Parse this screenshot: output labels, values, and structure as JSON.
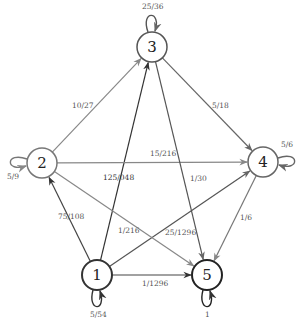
{
  "diagram": {
    "type": "markov-chain-state-graph",
    "nodes": [
      {
        "id": "1",
        "label": "1",
        "x": 97,
        "y": 275,
        "stroke": "#333333",
        "stroke_width": 2
      },
      {
        "id": "2",
        "label": "2",
        "x": 42,
        "y": 163,
        "stroke": "#777777",
        "stroke_width": 1.5
      },
      {
        "id": "3",
        "label": "3",
        "x": 152,
        "y": 47,
        "stroke": "#555555",
        "stroke_width": 1.5
      },
      {
        "id": "4",
        "label": "4",
        "x": 263,
        "y": 162,
        "stroke": "#666666",
        "stroke_width": 1.5
      },
      {
        "id": "5",
        "label": "5",
        "x": 207,
        "y": 275,
        "stroke": "#222222",
        "stroke_width": 2
      }
    ],
    "edges": [
      {
        "from": "1",
        "to": "2",
        "label": "75/108",
        "lx": 58,
        "ly": 219,
        "color": "#444444"
      },
      {
        "from": "1",
        "to": "3",
        "label": "125/048",
        "lx": 103,
        "ly": 180,
        "color": "#333333"
      },
      {
        "from": "1",
        "to": "4",
        "label": "25/1296",
        "lx": 165,
        "ly": 235,
        "color": "#555555"
      },
      {
        "from": "1",
        "to": "5",
        "label": "1/1296",
        "lx": 142,
        "ly": 286,
        "color": "#444444"
      },
      {
        "from": "2",
        "to": "3",
        "label": "10/27",
        "lx": 72,
        "ly": 108,
        "color": "#888888"
      },
      {
        "from": "2",
        "to": "4",
        "label": "15/216",
        "lx": 150,
        "ly": 156,
        "color": "#888888"
      },
      {
        "from": "2",
        "to": "5",
        "label": "1/216",
        "lx": 118,
        "ly": 233,
        "color": "#888888"
      },
      {
        "from": "3",
        "to": "4",
        "label": "5/18",
        "lx": 212,
        "ly": 108,
        "color": "#666666"
      },
      {
        "from": "3",
        "to": "5",
        "label": "1/30",
        "lx": 190,
        "ly": 181,
        "color": "#555555"
      },
      {
        "from": "4",
        "to": "5",
        "label": "1/6",
        "lx": 240,
        "ly": 220,
        "color": "#777777"
      }
    ],
    "self_loops": [
      {
        "node": "1",
        "label": "5/54",
        "lx": 90,
        "ly": 317,
        "side": "bottom"
      },
      {
        "node": "2",
        "label": "5/9",
        "lx": 7,
        "ly": 179,
        "side": "left"
      },
      {
        "node": "3",
        "label": "25/36",
        "lx": 142,
        "ly": 9,
        "side": "top"
      },
      {
        "node": "4",
        "label": "5/6",
        "lx": 281,
        "ly": 147,
        "side": "right"
      },
      {
        "node": "5",
        "label": "1",
        "lx": 205,
        "ly": 317,
        "side": "bottom"
      }
    ]
  }
}
